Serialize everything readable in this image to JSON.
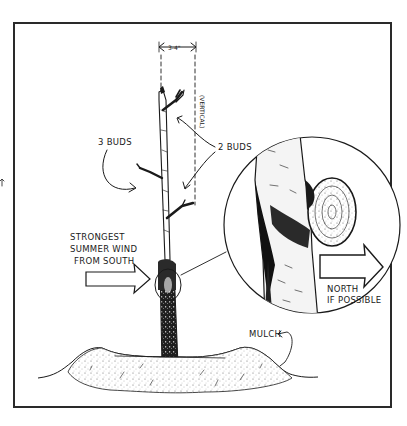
{
  "diagram": {
    "colors": {
      "ink": "#1a1a1a",
      "paper": "#ffffff",
      "frame": "#2a2a2a"
    },
    "labels": {
      "spacing": "3-4\"",
      "vertical": "(VERTICAL)",
      "three_buds": "3 BUDS",
      "two_buds": "2 BUDS",
      "wind_line1": "STRONGEST",
      "wind_line2": "SUMMER WIND",
      "wind_line3": "FROM SOUTH",
      "north_line1": "NORTH",
      "north_line2": "IF POSSIBLE",
      "mulch": "MULCH"
    },
    "elements": [
      "frame-border",
      "tree-trunk",
      "spacing-dimension",
      "vertical-guide",
      "bud-arrows",
      "wind-arrow",
      "detail-circle",
      "detail-callout",
      "north-arrow",
      "mulch-mound",
      "mulch-pointer"
    ]
  }
}
